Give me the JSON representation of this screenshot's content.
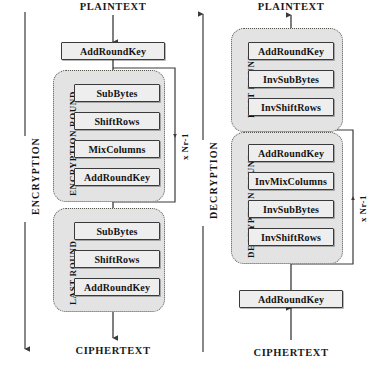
{
  "diagram": {
    "line_color": "#3a3a3a",
    "box_fill": "#eeeeee",
    "group_fill": "#e3e3e3",
    "text_color": "#141414"
  },
  "encryption": {
    "stage_label": "ENCRYPTION",
    "input_label": "PLAINTEXT",
    "output_label": "CIPHERTEXT",
    "initial_step": "AddRoundKey",
    "round": {
      "label": "ENCRYPTION ROUND",
      "loop_label": "x Nr-1",
      "steps": [
        "SubBytes",
        "ShiftRows",
        "MixColumns",
        "AddRoundKey"
      ]
    },
    "last_round": {
      "label": "LAST ROUND",
      "steps": [
        "SubBytes",
        "ShiftRows",
        "AddRoundKey"
      ]
    }
  },
  "decryption": {
    "stage_label": "DECRYPTION",
    "input_label": "CIPHERTEXT",
    "output_label": "PLAINTEXT",
    "initial_step": "AddRoundKey",
    "round": {
      "label": "DECRYPTION ROUND",
      "loop_label": "x Nr-1",
      "steps": [
        "AddRoundKey",
        "InvMixColumns",
        "InvSubBytes",
        "InvShiftRows"
      ]
    },
    "last_round": {
      "label": "LAST ROUND",
      "steps": [
        "AddRoundKey",
        "InvSubBytes",
        "InvShiftRows"
      ]
    }
  }
}
